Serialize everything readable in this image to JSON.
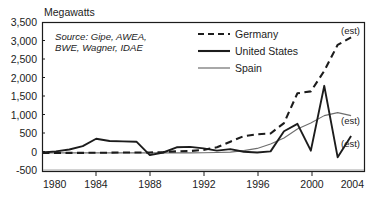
{
  "chart_data": {
    "type": "line",
    "title": "",
    "ylabel": "Megawatts",
    "xlabel": "",
    "xlim": [
      1980,
      2004
    ],
    "ylim": [
      -500,
      3500
    ],
    "grid": false,
    "legend_position": "top-right-inside",
    "x_ticks": [
      "1980",
      "1984",
      "1988",
      "1992",
      "1996",
      "2000",
      "2004"
    ],
    "y_ticks": [
      "3,500",
      "3,000",
      "2,500",
      "2,000",
      "1,500",
      "1,000",
      "500",
      "0",
      "-500"
    ],
    "source_note": "Source: Gipe, AWEA, BWE, Wagner, IDAE",
    "annotations": [
      {
        "text": "(est)",
        "series": "Germany",
        "x": 2003,
        "y": 3050
      },
      {
        "text": "(est)",
        "series": "Spain",
        "x": 2003,
        "y": 1000
      },
      {
        "text": "(est)",
        "series": "United States",
        "x": 2003,
        "y": 450
      }
    ],
    "x": [
      1980,
      1981,
      1982,
      1983,
      1984,
      1985,
      1986,
      1987,
      1988,
      1989,
      1990,
      1991,
      1992,
      1993,
      1994,
      1995,
      1996,
      1997,
      1998,
      1999,
      2000,
      2001,
      2002,
      2003
    ],
    "series": [
      {
        "name": "Germany",
        "style": "dashed",
        "color": "#1c1c1c",
        "values": [
          0,
          0,
          0,
          0,
          5,
          5,
          10,
          10,
          10,
          20,
          40,
          50,
          80,
          150,
          300,
          450,
          500,
          520,
          800,
          1600,
          1650,
          2200,
          2900,
          3100
        ]
      },
      {
        "name": "United States",
        "style": "solid-thick",
        "color": "#1c1c1c",
        "values": [
          10,
          40,
          90,
          180,
          380,
          320,
          310,
          300,
          -60,
          10,
          150,
          160,
          120,
          60,
          100,
          30,
          10,
          40,
          580,
          780,
          60,
          1800,
          -120,
          450
        ]
      },
      {
        "name": "Spain",
        "style": "solid-thin",
        "color": "#6e6e6e",
        "values": [
          0,
          0,
          0,
          0,
          0,
          0,
          0,
          0,
          0,
          0,
          0,
          0,
          5,
          10,
          20,
          60,
          120,
          240,
          400,
          640,
          800,
          1000,
          1080,
          1000
        ]
      }
    ]
  },
  "legend": {
    "items": [
      {
        "label": "Germany"
      },
      {
        "label": "United States"
      },
      {
        "label": "Spain"
      }
    ]
  }
}
